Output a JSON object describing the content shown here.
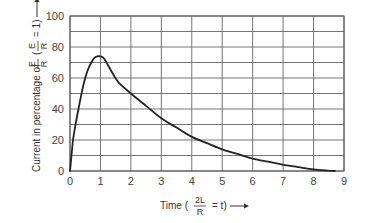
{
  "chart_data": {
    "type": "line",
    "title": "",
    "xlabel": "Time (2L/R = t)",
    "ylabel": "Current in percentage of E/R (E/R = 1)",
    "xlim": [
      0,
      9
    ],
    "ylim": [
      0,
      100
    ],
    "x_ticks": [
      "0",
      "1",
      "2",
      "3",
      "4",
      "5",
      "6",
      "7",
      "8",
      "9"
    ],
    "y_ticks": [
      "0",
      "20",
      "40",
      "60",
      "80",
      "100"
    ],
    "grid": true,
    "grid_y_step": 10,
    "grid_x_step": 1,
    "legend": null,
    "series": [
      {
        "name": "Current",
        "x": [
          0,
          0.05,
          0.1,
          0.2,
          0.3,
          0.4,
          0.5,
          0.6,
          0.7,
          0.8,
          0.9,
          1.0,
          1.1,
          1.2,
          1.4,
          1.6,
          2.0,
          2.5,
          3.0,
          3.5,
          4.0,
          4.5,
          5.0,
          5.5,
          6.0,
          6.5,
          7.0,
          7.5,
          8.0,
          8.5,
          8.7
        ],
        "values": [
          0,
          10,
          20,
          32,
          42,
          52,
          60,
          66,
          70,
          73,
          74,
          74,
          73,
          70,
          63,
          57,
          50,
          42,
          34,
          28,
          22,
          18,
          14,
          11,
          8,
          6,
          4,
          2.5,
          1,
          0.2,
          0
        ]
      }
    ]
  },
  "labels": {
    "ylabel_prefix": "Current in percentage of",
    "ylabel_frac1_num": "E",
    "ylabel_frac1_den": "R",
    "ylabel_paren_open": "(",
    "ylabel_frac2_num": "E",
    "ylabel_frac2_den": "R",
    "ylabel_suffix": "=  1)",
    "xlabel_prefix": "Time (",
    "xlabel_frac_num": "2L",
    "xlabel_frac_den": "R",
    "xlabel_suffix": "=  t)"
  }
}
